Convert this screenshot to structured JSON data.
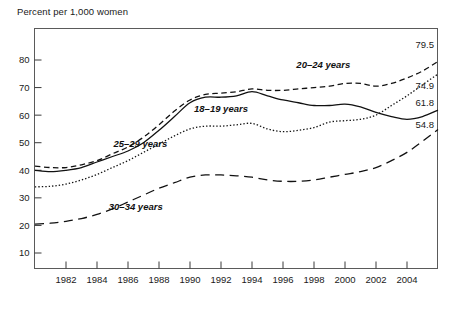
{
  "chart_data": {
    "type": "line",
    "title": "Percent per 1,000 women",
    "xlabel": "",
    "ylabel": "Percent per 1,000 women",
    "xlim": [
      1980,
      2006
    ],
    "ylim": [
      0,
      88
    ],
    "grid": false,
    "legend_position": "inline-annotations",
    "x_ticks": [
      "1982",
      "1984",
      "1986",
      "1988",
      "1990",
      "1992",
      "1994",
      "1996",
      "1998",
      "2000",
      "2002",
      "2004"
    ],
    "x_tick_values": [
      1982,
      1984,
      1986,
      1988,
      1990,
      1992,
      1994,
      1996,
      1998,
      2000,
      2002,
      2004
    ],
    "y_ticks": [
      "10",
      "20",
      "30",
      "40",
      "50",
      "60",
      "70",
      "80"
    ],
    "y_tick_values": [
      10,
      20,
      30,
      40,
      50,
      60,
      70,
      80
    ],
    "x": [
      1980,
      1981,
      1982,
      1983,
      1984,
      1985,
      1986,
      1987,
      1988,
      1989,
      1990,
      1991,
      1992,
      1993,
      1994,
      1995,
      1996,
      1997,
      1998,
      1999,
      2000,
      2001,
      2002,
      2003,
      2004,
      2005,
      2006
    ],
    "series": [
      {
        "name": "20–24 years",
        "label": "20–24 years",
        "style": "dashed",
        "end_value": "79.5",
        "values": [
          41.5,
          41.0,
          41.0,
          42.0,
          43.5,
          46.0,
          48.5,
          52.0,
          56.5,
          61.5,
          65.5,
          67.5,
          68.0,
          68.5,
          69.5,
          69.0,
          69.0,
          69.5,
          70.0,
          70.5,
          71.5,
          71.5,
          70.5,
          71.5,
          73.5,
          76.0,
          79.5
        ]
      },
      {
        "name": "25–29 years",
        "label": "25–29 years",
        "style": "dotted",
        "end_value": "74.9",
        "values": [
          34.0,
          34.2,
          35.0,
          36.5,
          38.5,
          41.0,
          43.5,
          46.5,
          49.5,
          52.5,
          55.0,
          56.0,
          56.0,
          56.5,
          57.0,
          55.0,
          54.0,
          54.5,
          55.5,
          57.5,
          58.0,
          58.5,
          60.0,
          63.5,
          67.0,
          71.0,
          74.9
        ]
      },
      {
        "name": "18–19 years",
        "label": "18–19 years",
        "style": "solid",
        "end_value": "61.8",
        "values": [
          40.0,
          39.5,
          40.0,
          41.0,
          43.0,
          45.0,
          47.0,
          50.0,
          54.5,
          59.5,
          64.5,
          66.5,
          66.5,
          67.0,
          68.5,
          67.0,
          65.5,
          64.5,
          63.5,
          63.5,
          64.0,
          63.0,
          61.0,
          59.5,
          58.5,
          59.5,
          61.8
        ]
      },
      {
        "name": "30–34 years",
        "label": "30–34 years",
        "style": "long-dashed",
        "end_value": "54.8",
        "values": [
          20.5,
          20.8,
          21.5,
          22.5,
          24.0,
          26.0,
          28.5,
          31.0,
          33.5,
          35.5,
          37.5,
          38.3,
          38.3,
          38.0,
          37.5,
          36.5,
          36.0,
          36.0,
          36.5,
          37.5,
          38.5,
          39.5,
          41.0,
          43.5,
          46.5,
          50.5,
          54.8
        ]
      }
    ],
    "annotations": [
      {
        "text": "20–24 years",
        "x": 1998.6,
        "y": 77.0
      },
      {
        "text": "18–19 years",
        "x": 1992.0,
        "y": 61.0
      },
      {
        "text": "25–29 years",
        "x": 1986.8,
        "y": 48.5
      },
      {
        "text": "30–34 years",
        "x": 1986.5,
        "y": 25.5
      }
    ],
    "end_labels": [
      {
        "text": "79.5",
        "series": "20–24 years"
      },
      {
        "text": "74.9",
        "series": "25–29 years"
      },
      {
        "text": "61.8",
        "series": "18–19 years"
      },
      {
        "text": "54.8",
        "series": "30–34 years"
      }
    ],
    "colors": {
      "line": "#111111",
      "frame": "#5a5a5a",
      "text": "#1a1a1a",
      "background": "#ffffff"
    }
  }
}
